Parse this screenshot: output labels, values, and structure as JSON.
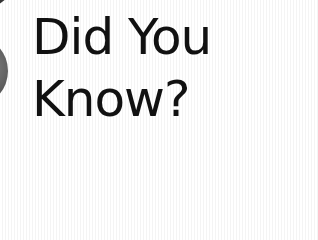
{
  "graphic": {
    "line1": "Did You",
    "line2": "Know?"
  }
}
